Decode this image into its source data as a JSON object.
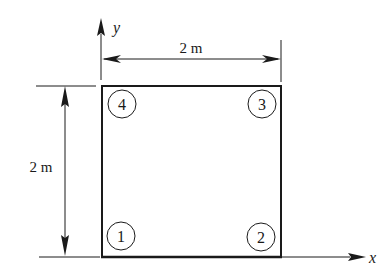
{
  "diagram": {
    "type": "square-element-with-nodes",
    "axes": {
      "x_label": "x",
      "y_label": "y"
    },
    "dimensions": {
      "width_label": "2 m",
      "height_label": "2 m"
    },
    "nodes": [
      {
        "id": "1",
        "label": "1",
        "position": "bottom-left"
      },
      {
        "id": "2",
        "label": "2",
        "position": "bottom-right"
      },
      {
        "id": "3",
        "label": "3",
        "position": "top-right"
      },
      {
        "id": "4",
        "label": "4",
        "position": "top-left"
      }
    ],
    "colors": {
      "line": "#1a1a1a",
      "background": "#ffffff"
    }
  }
}
